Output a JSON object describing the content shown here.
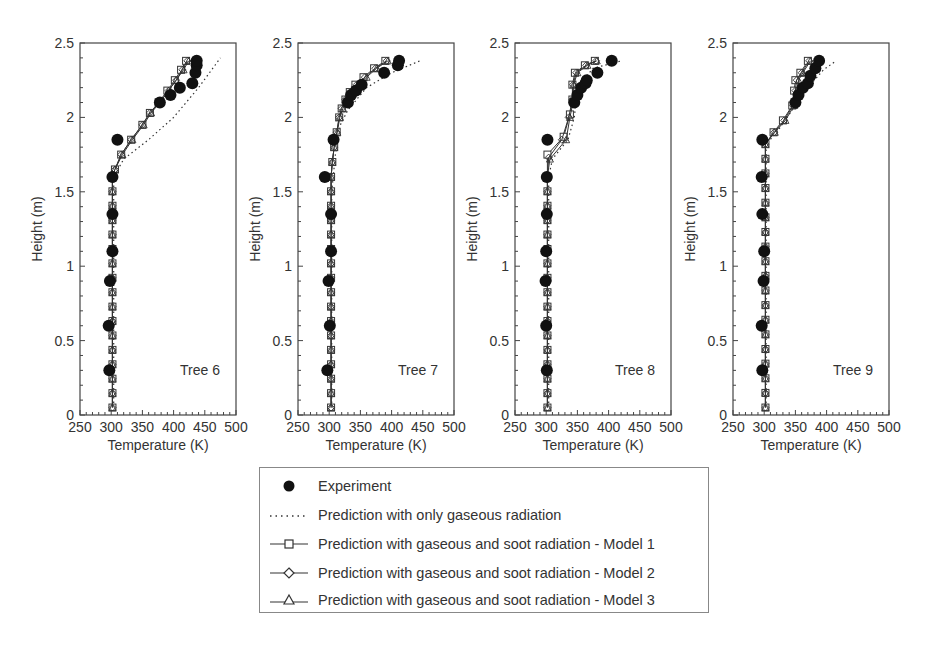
{
  "chart_data": [
    {
      "type": "line",
      "panel_label": "Tree 6",
      "xlabel": "Temperature (K)",
      "ylabel": "Height (m)",
      "xlim": [
        250,
        500
      ],
      "ylim": [
        0,
        2.5
      ],
      "xticks": [
        250,
        300,
        350,
        400,
        450,
        500
      ],
      "yticks": [
        0,
        0.5,
        1,
        1.5,
        2,
        2.5
      ],
      "series": [
        {
          "name": "Experiment",
          "points": [
            [
              297,
              0.3
            ],
            [
              296,
              0.6
            ],
            [
              298,
              0.9
            ],
            [
              302,
              1.1
            ],
            [
              302,
              1.35
            ],
            [
              302,
              1.6
            ],
            [
              310,
              1.85
            ],
            [
              378,
              2.1
            ],
            [
              395,
              2.15
            ],
            [
              410,
              2.2
            ],
            [
              430,
              2.23
            ],
            [
              435,
              2.3
            ],
            [
              437,
              2.35
            ],
            [
              437,
              2.38
            ]
          ]
        },
        {
          "name": "Prediction with only gaseous radiation",
          "points": [
            [
              304,
              0.05
            ],
            [
              304,
              1.6
            ],
            [
              320,
              1.72
            ],
            [
              360,
              1.85
            ],
            [
              400,
              2.0
            ],
            [
              440,
              2.2
            ],
            [
              475,
              2.4
            ]
          ]
        },
        {
          "name": "Prediction with gaseous and soot radiation - Model 1",
          "points": [
            [
              302,
              0.05
            ],
            [
              302,
              1.6
            ],
            [
              306,
              1.65
            ],
            [
              316,
              1.75
            ],
            [
              332,
              1.85
            ],
            [
              350,
              1.95
            ],
            [
              362,
              2.03
            ],
            [
              376,
              2.1
            ],
            [
              390,
              2.18
            ],
            [
              402,
              2.25
            ],
            [
              412,
              2.32
            ],
            [
              420,
              2.38
            ]
          ]
        },
        {
          "name": "Prediction with gaseous and soot radiation - Model 2",
          "points": [
            [
              302,
              0.05
            ],
            [
              302,
              1.6
            ],
            [
              306,
              1.65
            ],
            [
              316,
              1.75
            ],
            [
              332,
              1.85
            ],
            [
              350,
              1.95
            ],
            [
              362,
              2.03
            ],
            [
              378,
              2.1
            ],
            [
              392,
              2.18
            ],
            [
              404,
              2.25
            ],
            [
              414,
              2.32
            ],
            [
              422,
              2.38
            ]
          ]
        },
        {
          "name": "Prediction with gaseous and soot radiation - Model 3",
          "points": [
            [
              302,
              0.05
            ],
            [
              302,
              1.6
            ],
            [
              306,
              1.65
            ],
            [
              318,
              1.75
            ],
            [
              334,
              1.85
            ],
            [
              352,
              1.95
            ],
            [
              364,
              2.03
            ],
            [
              378,
              2.1
            ],
            [
              392,
              2.18
            ],
            [
              404,
              2.25
            ],
            [
              416,
              2.32
            ],
            [
              424,
              2.38
            ]
          ]
        }
      ]
    },
    {
      "type": "line",
      "panel_label": "Tree 7",
      "xlabel": "Temperature (K)",
      "ylabel": "Height (m)",
      "xlim": [
        250,
        500
      ],
      "ylim": [
        0,
        2.5
      ],
      "xticks": [
        250,
        300,
        350,
        400,
        450,
        500
      ],
      "yticks": [
        0,
        0.5,
        1,
        1.5,
        2,
        2.5
      ],
      "series": [
        {
          "name": "Experiment",
          "points": [
            [
              297,
              0.3
            ],
            [
              301,
              0.6
            ],
            [
              299,
              0.9
            ],
            [
              303,
              1.1
            ],
            [
              303,
              1.35
            ],
            [
              293,
              1.6
            ],
            [
              307,
              1.85
            ],
            [
              330,
              2.1
            ],
            [
              335,
              2.15
            ],
            [
              343,
              2.18
            ],
            [
              352,
              2.22
            ],
            [
              388,
              2.3
            ],
            [
              410,
              2.35
            ],
            [
              412,
              2.38
            ]
          ]
        },
        {
          "name": "Prediction with only gaseous radiation",
          "points": [
            [
              304,
              0.05
            ],
            [
              304,
              1.5
            ],
            [
              310,
              1.75
            ],
            [
              318,
              1.95
            ],
            [
              330,
              2.05
            ],
            [
              360,
              2.2
            ],
            [
              400,
              2.3
            ],
            [
              445,
              2.38
            ]
          ]
        },
        {
          "name": "Prediction with gaseous and soot radiation - Model 1",
          "points": [
            [
              303,
              0.05
            ],
            [
              303,
              1.6
            ],
            [
              305,
              1.7
            ],
            [
              308,
              1.8
            ],
            [
              312,
              1.9
            ],
            [
              316,
              2.0
            ],
            [
              320,
              2.06
            ],
            [
              326,
              2.12
            ],
            [
              333,
              2.17
            ],
            [
              342,
              2.22
            ],
            [
              355,
              2.27
            ],
            [
              372,
              2.33
            ],
            [
              390,
              2.38
            ]
          ]
        },
        {
          "name": "Prediction with gaseous and soot radiation - Model 2",
          "points": [
            [
              303,
              0.05
            ],
            [
              303,
              1.6
            ],
            [
              305,
              1.7
            ],
            [
              308,
              1.8
            ],
            [
              312,
              1.9
            ],
            [
              316,
              2.0
            ],
            [
              320,
              2.06
            ],
            [
              326,
              2.12
            ],
            [
              334,
              2.17
            ],
            [
              344,
              2.22
            ],
            [
              357,
              2.27
            ],
            [
              374,
              2.33
            ],
            [
              392,
              2.38
            ]
          ]
        },
        {
          "name": "Prediction with gaseous and soot radiation - Model 3",
          "points": [
            [
              303,
              0.05
            ],
            [
              303,
              1.6
            ],
            [
              305,
              1.7
            ],
            [
              308,
              1.8
            ],
            [
              313,
              1.9
            ],
            [
              317,
              2.0
            ],
            [
              322,
              2.06
            ],
            [
              328,
              2.12
            ],
            [
              336,
              2.17
            ],
            [
              346,
              2.22
            ],
            [
              360,
              2.27
            ],
            [
              376,
              2.33
            ],
            [
              394,
              2.38
            ]
          ]
        }
      ]
    },
    {
      "type": "line",
      "panel_label": "Tree 8",
      "xlabel": "Temperature (K)",
      "ylabel": "Height (m)",
      "xlim": [
        250,
        500
      ],
      "ylim": [
        0,
        2.5
      ],
      "xticks": [
        250,
        300,
        350,
        400,
        450,
        500
      ],
      "yticks": [
        0,
        0.5,
        1,
        1.5,
        2,
        2.5
      ],
      "series": [
        {
          "name": "Experiment",
          "points": [
            [
              301,
              0.3
            ],
            [
              300,
              0.6
            ],
            [
              299,
              0.9
            ],
            [
              300,
              1.1
            ],
            [
              301,
              1.35
            ],
            [
              301,
              1.6
            ],
            [
              302,
              1.85
            ],
            [
              345,
              2.1
            ],
            [
              350,
              2.15
            ],
            [
              356,
              2.2
            ],
            [
              363,
              2.23
            ],
            [
              365,
              2.25
            ],
            [
              382,
              2.3
            ],
            [
              405,
              2.38
            ]
          ]
        },
        {
          "name": "Prediction with only gaseous radiation",
          "points": [
            [
              304,
              0.05
            ],
            [
              304,
              1.6
            ],
            [
              310,
              1.72
            ],
            [
              335,
              1.85
            ],
            [
              345,
              2.0
            ],
            [
              350,
              2.2
            ],
            [
              375,
              2.33
            ],
            [
              420,
              2.38
            ]
          ]
        },
        {
          "name": "Prediction with gaseous and soot radiation - Model 1",
          "points": [
            [
              302,
              0.05
            ],
            [
              302,
              1.6
            ],
            [
              302,
              1.75
            ],
            [
              328,
              1.87
            ],
            [
              338,
              2.02
            ],
            [
              342,
              2.12
            ],
            [
              342,
              2.22
            ],
            [
              346,
              2.3
            ],
            [
              362,
              2.35
            ],
            [
              378,
              2.38
            ]
          ]
        },
        {
          "name": "Prediction with gaseous and soot radiation - Model 2",
          "points": [
            [
              302,
              0.05
            ],
            [
              302,
              1.6
            ],
            [
              304,
              1.73
            ],
            [
              325,
              1.85
            ],
            [
              336,
              2.0
            ],
            [
              342,
              2.12
            ],
            [
              343,
              2.22
            ],
            [
              348,
              2.3
            ],
            [
              364,
              2.35
            ],
            [
              380,
              2.38
            ]
          ]
        },
        {
          "name": "Prediction with gaseous and soot radiation - Model 3",
          "points": [
            [
              302,
              0.05
            ],
            [
              302,
              1.6
            ],
            [
              306,
              1.72
            ],
            [
              332,
              1.85
            ],
            [
              338,
              2.0
            ],
            [
              344,
              2.12
            ],
            [
              344,
              2.22
            ],
            [
              350,
              2.3
            ],
            [
              366,
              2.35
            ],
            [
              381,
              2.38
            ]
          ]
        }
      ]
    },
    {
      "type": "line",
      "panel_label": "Tree 9",
      "xlabel": "Temperature (K)",
      "ylabel": "Height (m)",
      "xlim": [
        250,
        500
      ],
      "ylim": [
        0,
        2.5
      ],
      "xticks": [
        250,
        300,
        350,
        400,
        450,
        500
      ],
      "yticks": [
        0,
        0.5,
        1,
        1.5,
        2,
        2.5
      ],
      "series": [
        {
          "name": "Experiment",
          "points": [
            [
              297,
              0.3
            ],
            [
              296,
              0.6
            ],
            [
              299,
              0.9
            ],
            [
              300,
              1.1
            ],
            [
              297,
              1.35
            ],
            [
              296,
              1.6
            ],
            [
              297,
              1.85
            ],
            [
              350,
              2.1
            ],
            [
              355,
              2.15
            ],
            [
              362,
              2.2
            ],
            [
              370,
              2.23
            ],
            [
              374,
              2.28
            ],
            [
              382,
              2.33
            ],
            [
              388,
              2.38
            ]
          ]
        },
        {
          "name": "Prediction with only gaseous radiation",
          "points": [
            [
              303,
              0.05
            ],
            [
              303,
              1.82
            ],
            [
              320,
              1.9
            ],
            [
              345,
              2.05
            ],
            [
              370,
              2.2
            ],
            [
              395,
              2.32
            ],
            [
              415,
              2.38
            ]
          ]
        },
        {
          "name": "Prediction with gaseous and soot radiation - Model 1",
          "points": [
            [
              302,
              0.05
            ],
            [
              302,
              1.82
            ],
            [
              315,
              1.9
            ],
            [
              330,
              1.98
            ],
            [
              345,
              2.08
            ],
            [
              348,
              2.18
            ],
            [
              350,
              2.25
            ],
            [
              358,
              2.3
            ],
            [
              370,
              2.38
            ]
          ]
        },
        {
          "name": "Prediction with gaseous and soot radiation - Model 2",
          "points": [
            [
              302,
              0.05
            ],
            [
              302,
              1.82
            ],
            [
              316,
              1.9
            ],
            [
              332,
              1.98
            ],
            [
              346,
              2.08
            ],
            [
              350,
              2.18
            ],
            [
              352,
              2.25
            ],
            [
              360,
              2.3
            ],
            [
              372,
              2.38
            ]
          ]
        },
        {
          "name": "Prediction with gaseous and soot radiation - Model 3",
          "points": [
            [
              302,
              0.05
            ],
            [
              302,
              1.82
            ],
            [
              317,
              1.9
            ],
            [
              334,
              1.98
            ],
            [
              348,
              2.08
            ],
            [
              352,
              2.18
            ],
            [
              355,
              2.25
            ],
            [
              362,
              2.3
            ],
            [
              374,
              2.38
            ]
          ]
        }
      ]
    }
  ],
  "legend": {
    "entries": [
      {
        "label": "Experiment",
        "symbol": "filled-circle"
      },
      {
        "label": "Prediction with only gaseous radiation",
        "symbol": "dotted-line"
      },
      {
        "label": "Prediction with gaseous and soot radiation - Model 1",
        "symbol": "line-square"
      },
      {
        "label": "Prediction with gaseous and soot radiation - Model 2",
        "symbol": "line-diamond"
      },
      {
        "label": "Prediction with gaseous and soot radiation - Model 3",
        "symbol": "line-triangle"
      }
    ]
  },
  "colors": {
    "axis": "#444444",
    "marker": "#111111",
    "line": "#333333",
    "text": "#333333"
  }
}
